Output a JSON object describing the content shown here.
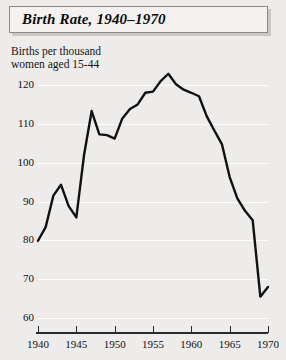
{
  "figure": {
    "title": "Birth Rate, 1940–1970",
    "caption_line1": "Births per thousand",
    "caption_line2": "women aged 15-44"
  },
  "chart_data": {
    "type": "line",
    "title": "Birth Rate, 1940–1970",
    "xlabel": "",
    "ylabel": "Births per thousand women aged 15-44",
    "xlim": [
      1940,
      1970
    ],
    "ylim": [
      60,
      125
    ],
    "grid": true,
    "legend": "none",
    "line_color": "#111111",
    "x": [
      1940,
      1941,
      1942,
      1943,
      1944,
      1945,
      1946,
      1947,
      1948,
      1949,
      1950,
      1951,
      1952,
      1953,
      1954,
      1955,
      1956,
      1957,
      1958,
      1959,
      1960,
      1961,
      1962,
      1963,
      1964,
      1965,
      1966,
      1967,
      1968,
      1969,
      1970
    ],
    "values": [
      79.9,
      83.4,
      91.5,
      94.3,
      88.8,
      85.9,
      101.9,
      113.3,
      107.3,
      107.1,
      106.2,
      111.4,
      113.8,
      115.0,
      118.0,
      118.3,
      121.0,
      122.9,
      120.2,
      118.8,
      118.0,
      117.1,
      112.0,
      108.3,
      104.7,
      96.3,
      90.8,
      87.6,
      85.2,
      65.5,
      68.0
    ],
    "series": [
      {
        "name": "Birth rate",
        "values": [
          79.9,
          83.4,
          91.5,
          94.3,
          88.8,
          85.9,
          101.9,
          113.3,
          107.3,
          107.1,
          106.2,
          111.4,
          113.8,
          115.0,
          118.0,
          118.3,
          121.0,
          122.9,
          120.2,
          118.8,
          118.0,
          117.1,
          112.0,
          108.3,
          104.7,
          96.3,
          90.8,
          87.6,
          85.2,
          65.5,
          68.0
        ]
      }
    ],
    "yticks": [
      60,
      70,
      80,
      90,
      100,
      110,
      120
    ],
    "ytick_labels": [
      "60",
      "70",
      "80",
      "90",
      "100",
      "110",
      "120"
    ],
    "xticks": [
      1940,
      1945,
      1950,
      1955,
      1960,
      1965,
      1970
    ],
    "xtick_labels": [
      "1940",
      "1945",
      "1950",
      "1955",
      "1960",
      "1965",
      "1970"
    ]
  }
}
